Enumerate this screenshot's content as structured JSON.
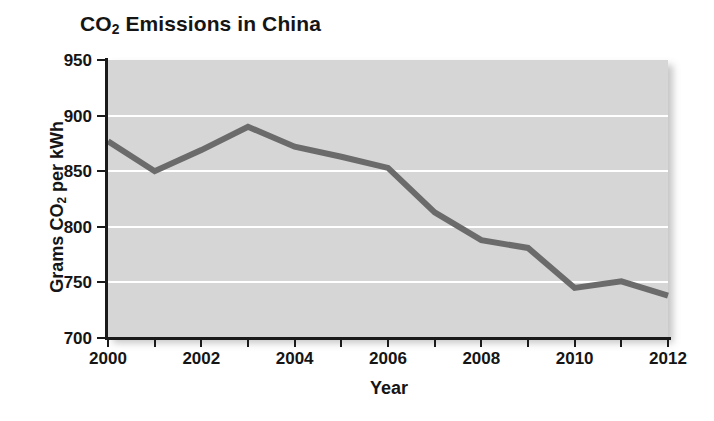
{
  "chart_data": {
    "type": "line",
    "title": "CO2 Emissions in China",
    "title_main": "CO",
    "title_sub": "2",
    "title_rest": " Emissions in China",
    "xlabel": "Year",
    "ylabel": "Grams CO2 per kWh",
    "ylabel_main": "Grams CO",
    "ylabel_sub": "2",
    "ylabel_rest": " per kWh",
    "x": [
      2000,
      2001,
      2002,
      2003,
      2004,
      2005,
      2006,
      2007,
      2008,
      2009,
      2010,
      2011,
      2012
    ],
    "values": [
      877,
      850,
      869,
      890,
      872,
      863,
      853,
      813,
      788,
      781,
      745,
      751,
      738
    ],
    "xlim": [
      2000,
      2012
    ],
    "ylim": [
      700,
      950
    ],
    "y_ticks": [
      950,
      900,
      850,
      800,
      750,
      700
    ],
    "y_tick_labels": [
      "950",
      "900",
      "850",
      "800",
      "750",
      "700"
    ],
    "x_ticks": [
      2000,
      2001,
      2002,
      2003,
      2004,
      2005,
      2006,
      2007,
      2008,
      2009,
      2010,
      2011,
      2012
    ],
    "x_tick_labels": [
      "2000",
      "",
      "2002",
      "",
      "2004",
      "",
      "2006",
      "",
      "2008",
      "",
      "2010",
      "",
      "2012"
    ],
    "grid": "horizontal-only",
    "gridlines_at": [
      900,
      850,
      800,
      750
    ],
    "legend": "none",
    "line_color": "#6b6b6b",
    "line_width": 6,
    "plot_background": "#d6d6d6",
    "gridline_color": "#ffffff",
    "axis_color": "#1a1a1a",
    "text_color": "#151515",
    "figure_background": "#ffffff"
  }
}
